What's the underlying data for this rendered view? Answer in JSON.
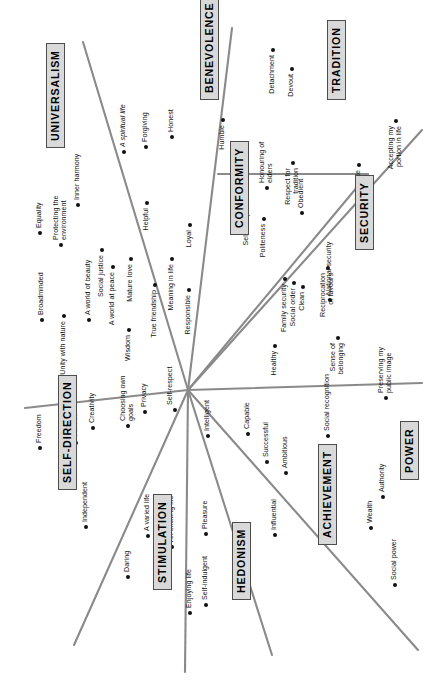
{
  "figure": {
    "type": "circumplex-diagram",
    "rotation_deg": -90,
    "center": {
      "x": 188,
      "y": 390
    },
    "colors": {
      "line": "#8a8a8a",
      "dot": "#111111",
      "label_text": "#111111",
      "category_fill": "#d9d9d9",
      "category_border": "#4d4d4d",
      "background": "#ffffff"
    }
  },
  "categories": [
    {
      "id": "universalism",
      "label": "UNIVERSALISM",
      "x": 46,
      "y": 148
    },
    {
      "id": "benevolence",
      "label": "BENEVOLENCE",
      "x": 200,
      "y": 100
    },
    {
      "id": "tradition",
      "label": "TRADITION",
      "x": 327,
      "y": 100
    },
    {
      "id": "conformity",
      "label": "CONFORMITY",
      "x": 230,
      "y": 235
    },
    {
      "id": "security",
      "label": "SECURITY",
      "x": 355,
      "y": 250
    },
    {
      "id": "power",
      "label": "POWER",
      "x": 400,
      "y": 480
    },
    {
      "id": "achievement",
      "label": "ACHIEVEMENT",
      "x": 318,
      "y": 545
    },
    {
      "id": "hedonism",
      "label": "HEDONISM",
      "x": 232,
      "y": 600
    },
    {
      "id": "stimulation",
      "label": "STIMULATION",
      "x": 153,
      "y": 590
    },
    {
      "id": "self_direction",
      "label": "SELF-DIRECTION",
      "x": 58,
      "y": 490
    }
  ],
  "values": [
    {
      "id": "equality",
      "label": "Equality",
      "category": "universalism",
      "x": 40,
      "y": 233,
      "flip": false,
      "lines": 1
    },
    {
      "id": "protecting_env",
      "label": "Protecting the environment",
      "category": "universalism",
      "x": 61,
      "y": 245,
      "flip": false,
      "lines": 2
    },
    {
      "id": "inner_harmony",
      "label": "Inner harmony",
      "category": "universalism",
      "x": 78,
      "y": 205,
      "flip": false,
      "lines": 1
    },
    {
      "id": "social_justice",
      "label": "Social justice",
      "category": "universalism",
      "x": 102,
      "y": 250,
      "flip": true,
      "lines": 1
    },
    {
      "id": "a_world_at_peace",
      "label": "A world at peace",
      "category": "universalism",
      "x": 113,
      "y": 267,
      "flip": true,
      "lines": 1
    },
    {
      "id": "mature_love",
      "label": "Mature love",
      "category": "universalism",
      "x": 131,
      "y": 259,
      "flip": true,
      "lines": 1
    },
    {
      "id": "broadminded",
      "label": "Broadminded",
      "category": "universalism",
      "x": 42,
      "y": 320,
      "flip": false,
      "lines": 1
    },
    {
      "id": "unity_with_nature",
      "label": "Unity with nature",
      "category": "universalism",
      "x": 64,
      "y": 316,
      "flip": true,
      "lines": 1
    },
    {
      "id": "a_world_of_beauty",
      "label": "A world of beauty",
      "category": "universalism",
      "x": 89,
      "y": 320,
      "flip": false,
      "lines": 1
    },
    {
      "id": "wisdom",
      "label": "Wisdom",
      "category": "universalism",
      "x": 129,
      "y": 330,
      "flip": true,
      "lines": 1
    },
    {
      "id": "a_spiritual_life",
      "label": "A spiritual life",
      "category": "benevolence",
      "x": 124,
      "y": 152,
      "flip": false,
      "lines": 1,
      "italic": true
    },
    {
      "id": "forgiving",
      "label": "Forgiving",
      "category": "benevolence",
      "x": 146,
      "y": 147,
      "flip": false,
      "lines": 1
    },
    {
      "id": "honest",
      "label": "Honest",
      "category": "benevolence",
      "x": 172,
      "y": 137,
      "flip": false,
      "lines": 1
    },
    {
      "id": "helpful",
      "label": "Helpful",
      "category": "benevolence",
      "x": 147,
      "y": 203,
      "flip": true,
      "lines": 1
    },
    {
      "id": "true_friendship",
      "label": "True friendship",
      "category": "benevolence",
      "x": 155,
      "y": 285,
      "flip": true,
      "lines": 1
    },
    {
      "id": "meaning_in_life",
      "label": "Meaning in life",
      "category": "benevolence",
      "x": 172,
      "y": 259,
      "flip": true,
      "lines": 1
    },
    {
      "id": "loyal",
      "label": "Loyal",
      "category": "benevolence",
      "x": 190,
      "y": 225,
      "flip": true,
      "lines": 1
    },
    {
      "id": "responsible",
      "label": "Responsible",
      "category": "benevolence",
      "x": 189,
      "y": 290,
      "flip": true,
      "lines": 1
    },
    {
      "id": "humble",
      "label": "Humble",
      "category": "benevolence",
      "x": 223,
      "y": 120,
      "flip": true,
      "lines": 1
    },
    {
      "id": "detachment",
      "label": "Detachment",
      "category": "tradition",
      "x": 273,
      "y": 50,
      "flip": true,
      "lines": 1
    },
    {
      "id": "devout",
      "label": "Devout",
      "category": "tradition",
      "x": 292,
      "y": 69,
      "flip": true,
      "lines": 1
    },
    {
      "id": "respect_tradition",
      "label": "Respect for tradition",
      "category": "tradition",
      "x": 293,
      "y": 163,
      "flip": true,
      "lines": 2
    },
    {
      "id": "moderate",
      "label": "Moderate",
      "category": "tradition",
      "x": 359,
      "y": 165,
      "flip": true,
      "lines": 1
    },
    {
      "id": "accepting_portion",
      "label": "Accepting my portion in life",
      "category": "tradition",
      "x": 396,
      "y": 121,
      "flip": true,
      "lines": 2
    },
    {
      "id": "self_discipline",
      "label": "Self-discipline",
      "category": "conformity",
      "x": 247,
      "y": 196,
      "flip": true,
      "lines": 1
    },
    {
      "id": "politeness",
      "label": "Politeness",
      "category": "conformity",
      "x": 264,
      "y": 219,
      "flip": true,
      "lines": 1
    },
    {
      "id": "honouring_elders",
      "label": "Honouring of elders",
      "category": "conformity",
      "x": 267,
      "y": 188,
      "flip": false,
      "lines": 2
    },
    {
      "id": "obedient",
      "label": "Obedient",
      "category": "conformity",
      "x": 302,
      "y": 213,
      "flip": false,
      "lines": 1
    },
    {
      "id": "family_security",
      "label": "Family security",
      "category": "security",
      "x": 285,
      "y": 279,
      "flip": true,
      "lines": 1
    },
    {
      "id": "social_order",
      "label": "Social order",
      "category": "security",
      "x": 294,
      "y": 283,
      "flip": true,
      "lines": 1
    },
    {
      "id": "clean",
      "label": "Clean",
      "category": "security",
      "x": 303,
      "y": 287,
      "flip": true,
      "lines": 1
    },
    {
      "id": "reciprocation",
      "label": "Reciprocation of favours",
      "category": "security",
      "x": 328,
      "y": 268,
      "flip": true,
      "lines": 2
    },
    {
      "id": "national_security",
      "label": "National security",
      "category": "security",
      "x": 330,
      "y": 300,
      "flip": false,
      "lines": 1
    },
    {
      "id": "healthy",
      "label": "Healthy",
      "category": "security",
      "x": 275,
      "y": 346,
      "flip": true,
      "lines": 1
    },
    {
      "id": "sense_of_belonging",
      "label": "Sense of belonging",
      "category": "security",
      "x": 338,
      "y": 338,
      "flip": true,
      "lines": 2
    },
    {
      "id": "social_recognition",
      "label": "Social recognition",
      "category": "power",
      "x": 328,
      "y": 436,
      "flip": false,
      "lines": 1
    },
    {
      "id": "preserving_image",
      "label": "Preserving my public image",
      "category": "power",
      "x": 386,
      "y": 398,
      "flip": false,
      "lines": 2
    },
    {
      "id": "authority",
      "label": "Authority",
      "category": "power",
      "x": 383,
      "y": 497,
      "flip": false,
      "lines": 1
    },
    {
      "id": "wealth",
      "label": "Wealth",
      "category": "power",
      "x": 371,
      "y": 528,
      "flip": false,
      "lines": 1
    },
    {
      "id": "social_power",
      "label": "Social power",
      "category": "power",
      "x": 395,
      "y": 585,
      "flip": false,
      "lines": 1
    },
    {
      "id": "capable",
      "label": "Capable",
      "category": "achievement",
      "x": 248,
      "y": 434,
      "flip": false,
      "lines": 1
    },
    {
      "id": "successful",
      "label": "Successful",
      "category": "achievement",
      "x": 267,
      "y": 462,
      "flip": false,
      "lines": 1
    },
    {
      "id": "ambitious",
      "label": "Ambitious",
      "category": "achievement",
      "x": 286,
      "y": 473,
      "flip": false,
      "lines": 1
    },
    {
      "id": "influential",
      "label": "Influential",
      "category": "achievement",
      "x": 275,
      "y": 535,
      "flip": false,
      "lines": 1
    },
    {
      "id": "intelligent",
      "label": "Intelligent",
      "category": "achievement",
      "x": 208,
      "y": 436,
      "flip": false,
      "lines": 1
    },
    {
      "id": "pleasure",
      "label": "Pleasure",
      "category": "hedonism",
      "x": 206,
      "y": 534,
      "flip": false,
      "lines": 1
    },
    {
      "id": "enjoying_life",
      "label": "Enjoying life",
      "category": "hedonism",
      "x": 190,
      "y": 613,
      "flip": false,
      "lines": 1
    },
    {
      "id": "self_indulgent",
      "label": "Self-indulgent",
      "category": "hedonism",
      "x": 206,
      "y": 605,
      "flip": false,
      "lines": 1
    },
    {
      "id": "a_varied_life",
      "label": "A varied life",
      "category": "stimulation",
      "x": 148,
      "y": 536,
      "flip": false,
      "lines": 1
    },
    {
      "id": "an_exciting_life",
      "label": "An exciting life",
      "category": "stimulation",
      "x": 172,
      "y": 547,
      "flip": false,
      "lines": 1
    },
    {
      "id": "daring",
      "label": "Daring",
      "category": "stimulation",
      "x": 128,
      "y": 577,
      "flip": false,
      "lines": 1
    },
    {
      "id": "freedom",
      "label": "Freedom",
      "category": "self_direction",
      "x": 40,
      "y": 448,
      "flip": false,
      "lines": 1
    },
    {
      "id": "curious",
      "label": "Curious",
      "category": "self_direction",
      "x": 76,
      "y": 443,
      "flip": false,
      "lines": 1
    },
    {
      "id": "creativity",
      "label": "Creativity",
      "category": "self_direction",
      "x": 93,
      "y": 428,
      "flip": false,
      "lines": 1
    },
    {
      "id": "choosing_own_goals",
      "label": "Choosing own goals",
      "category": "self_direction",
      "x": 128,
      "y": 426,
      "flip": false,
      "lines": 2
    },
    {
      "id": "privacy",
      "label": "Privacy",
      "category": "self_direction",
      "x": 145,
      "y": 412,
      "flip": false,
      "lines": 1
    },
    {
      "id": "self_respect",
      "label": "Self-respect",
      "category": "self_direction",
      "x": 175,
      "y": 410,
      "flip": false,
      "lines": 2
    },
    {
      "id": "independent",
      "label": "Independent",
      "category": "self_direction",
      "x": 86,
      "y": 527,
      "flip": false,
      "lines": 1
    }
  ],
  "divider_lines": [
    {
      "id": "universalism-benevolence",
      "x1": 188,
      "y1": 390,
      "x2": 83,
      "y2": 42
    },
    {
      "id": "benevolence-tradition",
      "x1": 188,
      "y1": 390,
      "x2": 232,
      "y2": 28
    },
    {
      "id": "conformity-tradition",
      "x1": 188,
      "y1": 390,
      "x2": 368,
      "y2": 174
    },
    {
      "id": "tradition-security",
      "x1": 218,
      "y1": 174,
      "x2": 368,
      "y2": 174
    },
    {
      "id": "security-power",
      "x1": 188,
      "y1": 390,
      "x2": 422,
      "y2": 130
    },
    {
      "id": "power-horizontal",
      "x1": 188,
      "y1": 390,
      "x2": 422,
      "y2": 383
    },
    {
      "id": "achievement-power",
      "x1": 188,
      "y1": 390,
      "x2": 418,
      "y2": 650
    },
    {
      "id": "hedonism-achievement",
      "x1": 188,
      "y1": 390,
      "x2": 272,
      "y2": 655
    },
    {
      "id": "stimulation-hedonism",
      "x1": 188,
      "y1": 390,
      "x2": 185,
      "y2": 672
    },
    {
      "id": "selfdir-stimulation",
      "x1": 188,
      "y1": 390,
      "x2": 74,
      "y2": 645
    },
    {
      "id": "selfdir-universalism",
      "x1": 188,
      "y1": 390,
      "x2": 25,
      "y2": 408
    }
  ]
}
